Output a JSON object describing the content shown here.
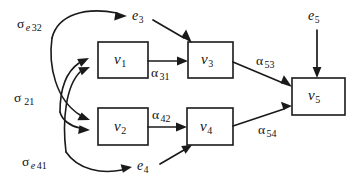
{
  "figure": {
    "type": "path-diagram",
    "background_color": "#ffffff",
    "stroke_color": "#1a1a1a"
  },
  "nodes": [
    {
      "id": "v1",
      "glyph": "v",
      "subscript": "1",
      "shape": "box"
    },
    {
      "id": "v2",
      "glyph": "v",
      "subscript": "2",
      "shape": "box"
    },
    {
      "id": "v3",
      "glyph": "v",
      "subscript": "3",
      "shape": "box"
    },
    {
      "id": "v4",
      "glyph": "v",
      "subscript": "4",
      "shape": "box"
    },
    {
      "id": "v5",
      "glyph": "v",
      "subscript": "5",
      "shape": "box"
    }
  ],
  "error_terms": [
    {
      "id": "e3",
      "glyph": "e",
      "subscript": "3"
    },
    {
      "id": "e4",
      "glyph": "e",
      "subscript": "4"
    },
    {
      "id": "e5",
      "glyph": "e",
      "subscript": "5"
    }
  ],
  "path_labels": [
    {
      "id": "alpha31",
      "symbol": "α",
      "subscript": "31",
      "from": "v1",
      "to": "v3"
    },
    {
      "id": "alpha42",
      "symbol": "α",
      "subscript": "42",
      "from": "v2",
      "to": "v4"
    },
    {
      "id": "alpha53",
      "symbol": "α",
      "subscript": "53",
      "from": "v3",
      "to": "v5"
    },
    {
      "id": "alpha54",
      "symbol": "α",
      "subscript": "54",
      "from": "v4",
      "to": "v5"
    }
  ],
  "covariance_labels": [
    {
      "id": "sigma_e32",
      "symbol": "σ",
      "subscript_italic": "e",
      "subscript": "32"
    },
    {
      "id": "sigma_21",
      "symbol": "σ",
      "subscript_italic": "",
      "subscript": "21"
    },
    {
      "id": "sigma_e41",
      "symbol": "σ",
      "subscript_italic": "e",
      "subscript": "41"
    }
  ]
}
